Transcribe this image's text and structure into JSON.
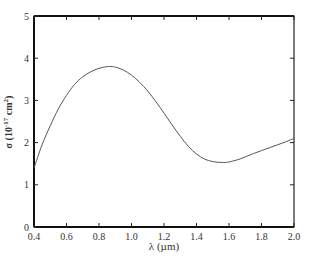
{
  "chart_data": {
    "type": "line",
    "title": "",
    "xlabel": "λ (µm)",
    "ylabel": "σ (10⁻¹⁷ cm²)",
    "xlim": [
      0.4,
      2.0
    ],
    "ylim": [
      0,
      5
    ],
    "x_ticks": [
      "0.4",
      "0.6",
      "0.8",
      "1.0",
      "1.2",
      "1.4",
      "1.6",
      "1.8",
      "2.0"
    ],
    "y_ticks": [
      "0",
      "1",
      "2",
      "3",
      "4",
      "5"
    ],
    "grid": false,
    "legend": null,
    "series": [
      {
        "name": "cross-section",
        "color": "#555555",
        "x": [
          0.4,
          0.45,
          0.5,
          0.55,
          0.6,
          0.65,
          0.7,
          0.75,
          0.8,
          0.85,
          0.88,
          0.9,
          0.95,
          1.0,
          1.05,
          1.1,
          1.15,
          1.2,
          1.25,
          1.3,
          1.35,
          1.4,
          1.45,
          1.5,
          1.55,
          1.58,
          1.6,
          1.65,
          1.7,
          1.75,
          1.8,
          1.85,
          1.9,
          1.95,
          2.0
        ],
        "y": [
          1.4,
          1.95,
          2.4,
          2.8,
          3.12,
          3.38,
          3.56,
          3.68,
          3.76,
          3.8,
          3.8,
          3.79,
          3.72,
          3.6,
          3.43,
          3.22,
          2.97,
          2.7,
          2.42,
          2.15,
          1.91,
          1.73,
          1.61,
          1.55,
          1.53,
          1.53,
          1.54,
          1.59,
          1.66,
          1.74,
          1.81,
          1.88,
          1.95,
          2.02,
          2.1
        ]
      }
    ]
  },
  "labels": {
    "xlabel": "λ (µm)",
    "ylabel_main": "σ (10",
    "ylabel_exp": "-17",
    "ylabel_unit": " cm",
    "ylabel_unit_exp": "2",
    "ylabel_close": ")"
  }
}
